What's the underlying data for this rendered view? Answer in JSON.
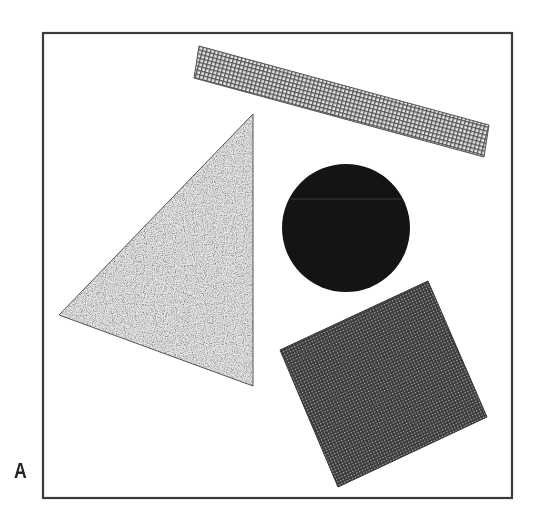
{
  "panel_label": "A",
  "colors": {
    "frame": "#3a3a3a",
    "circle": "#141414",
    "square": "#4a4a4a",
    "rect_fill": "#9a9a9a",
    "triangle_fill": "#cfcfcf",
    "background": "#ffffff"
  },
  "shapes": {
    "frame": {
      "x": 43,
      "y": 33,
      "width": 469,
      "height": 465
    },
    "rectangle": {
      "points": "199,46 489,125 484,157 194,78",
      "pattern": "grid"
    },
    "triangle": {
      "points": "253,114 253,386 59,315",
      "pattern": "speckle"
    },
    "circle": {
      "cx": 346,
      "cy": 228,
      "r": 64,
      "pattern": "solid-dark"
    },
    "square": {
      "points": "428,281 487,417 338,487 280,350",
      "pattern": "checker-dark"
    }
  }
}
